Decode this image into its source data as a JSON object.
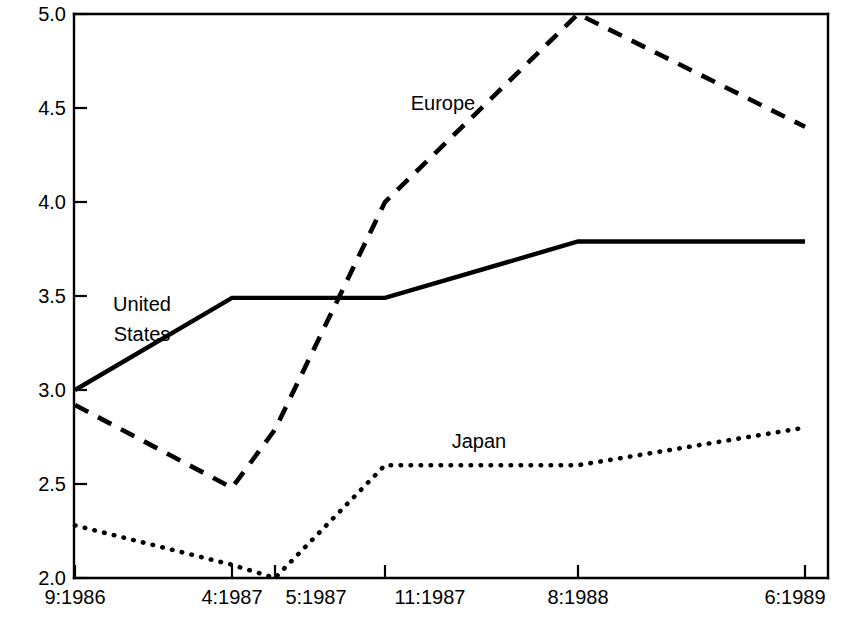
{
  "chart_data": {
    "type": "line",
    "title": "",
    "subtitle": "",
    "xlabel": "",
    "ylabel": "",
    "x": [
      "9:1986",
      "4:1987",
      "5:1987",
      "11:1987",
      "8:1988",
      "6:1989"
    ],
    "categories": [
      "9:1986",
      "4:1987",
      "5:1987",
      "11:1987",
      "8:1988",
      "6:1989"
    ],
    "xtick_labels": [
      "9:1986",
      "4:1987",
      "5:1987",
      "11:1987",
      "8:1988",
      "6:1989"
    ],
    "ytick_labels": [
      "5.0",
      "4.5",
      "4.0",
      "3.5",
      "3.0",
      "2.5",
      "2.0"
    ],
    "ytick_values": [
      5.0,
      4.5,
      4.0,
      3.5,
      3.0,
      2.5,
      2.0
    ],
    "ylim": [
      2.0,
      5.0
    ],
    "grid": false,
    "legend": "inline-annotations",
    "legend_position": "inline",
    "series": [
      {
        "name": "United States",
        "style": "solid",
        "color": "#000000",
        "values": [
          3.0,
          3.49,
          3.49,
          3.49,
          3.79,
          3.79
        ]
      },
      {
        "name": "Europe",
        "style": "dashed",
        "color": "#000000",
        "values": [
          2.92,
          2.48,
          2.79,
          4.0,
          5.0,
          4.4
        ]
      },
      {
        "name": "Japan",
        "style": "dotted",
        "color": "#000000",
        "values": [
          2.28,
          2.07,
          2.0,
          2.6,
          2.6,
          2.8
        ]
      }
    ],
    "annotations": [
      {
        "text": "United States",
        "series": "United States",
        "lines": [
          "United",
          "States"
        ]
      },
      {
        "text": "Europe",
        "series": "Europe",
        "lines": [
          "Europe"
        ]
      },
      {
        "text": "Japan",
        "series": "Japan",
        "lines": [
          "Japan"
        ]
      }
    ]
  },
  "axes": {
    "y_labels": [
      "5.0",
      "4.5",
      "4.0",
      "3.5",
      "3.0",
      "2.5",
      "2.0"
    ],
    "x_labels": [
      "9:1986",
      "4:1987",
      "5:1987",
      "11:1987",
      "8:1988",
      "6:1989"
    ]
  },
  "labels": {
    "united_states_line1": "United",
    "united_states_line2": "States",
    "europe": "Europe",
    "japan": "Japan"
  }
}
